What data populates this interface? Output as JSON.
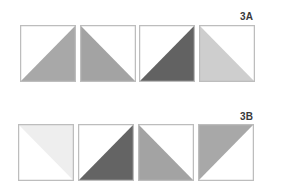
{
  "rows": [
    {
      "label": "3A",
      "tiles": [
        {
          "shape": "bottom-right",
          "color": "#a8a8a8"
        },
        {
          "shape": "bottom-left",
          "color": "#a3a3a3"
        },
        {
          "shape": "bottom-right",
          "color": "#626262"
        },
        {
          "shape": "bottom-left",
          "color": "#cecece"
        }
      ]
    },
    {
      "label": "3B",
      "tiles": [
        {
          "shape": "top-right",
          "color": "#eeeeee"
        },
        {
          "shape": "bottom-right",
          "color": "#646464"
        },
        {
          "shape": "bottom-left",
          "color": "#a3a3a3"
        },
        {
          "shape": "top-left",
          "color": "#a8a8a8"
        }
      ]
    }
  ],
  "colors": {
    "border": "#bdbdbd",
    "label": "#3a3a3a",
    "background": "#ffffff"
  }
}
